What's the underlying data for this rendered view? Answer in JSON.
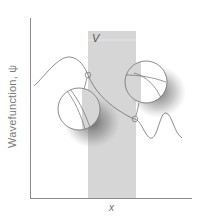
{
  "figure": {
    "y_axis_label": "Wavefunction, ψ",
    "x_axis_label": "x",
    "barrier_label": "V",
    "colors": {
      "axis": "#8a8a8a",
      "barrier": "#d6d6d6",
      "curve": "#6e6e6e",
      "magnifier_border": "#6e6e6e",
      "shadow": "#555555"
    },
    "barrier_region": {
      "x_start": 88,
      "x_end": 136,
      "y_top": 31,
      "y_bottom": 198
    },
    "magnifiers": [
      {
        "name": "left-boundary-magnifier",
        "cx": 79,
        "cy": 109,
        "r": 21,
        "anchor": {
          "x": 88,
          "y": 75
        }
      },
      {
        "name": "right-boundary-magnifier",
        "cx": 146,
        "cy": 82,
        "r": 21,
        "anchor": {
          "x": 135,
          "y": 119
        }
      }
    ]
  }
}
